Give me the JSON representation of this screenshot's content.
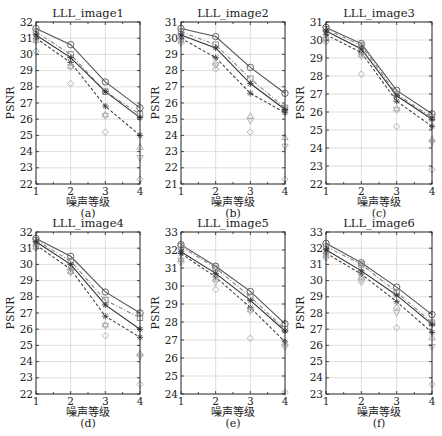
{
  "chart_data": [
    {
      "id": "a",
      "type": "line",
      "title": "LLL_image1",
      "caption": "(a)",
      "xlabel": "噪声等级",
      "ylabel": "PSNR",
      "x": [
        1,
        2,
        3,
        4
      ],
      "xlim": [
        1,
        4
      ],
      "ylim": [
        22,
        32
      ],
      "yticks": [
        22,
        23,
        24,
        25,
        26,
        27,
        28,
        29,
        30,
        31,
        32
      ],
      "grid": true,
      "series": [
        {
          "name": "s1",
          "style": "solid",
          "marker": "circle",
          "color": "#555555",
          "values": [
            31.6,
            30.6,
            28.3,
            26.7
          ]
        },
        {
          "name": "s2",
          "style": "dashdot",
          "marker": "square",
          "color": "#888888",
          "values": [
            31.4,
            30.0,
            27.7,
            26.3
          ]
        },
        {
          "name": "s3",
          "style": "solid",
          "marker": "star",
          "color": "#333333",
          "values": [
            31.2,
            29.8,
            27.7,
            26.1
          ]
        },
        {
          "name": "s4",
          "style": "dashed",
          "marker": "asterisk",
          "color": "#444444",
          "values": [
            31.0,
            29.5,
            26.8,
            25.0
          ]
        },
        {
          "name": "s5",
          "style": "none",
          "marker": "triangle-up",
          "color": "#aaaaaa",
          "values": [
            30.9,
            29.3,
            26.3,
            24.3
          ]
        },
        {
          "name": "s6",
          "style": "none",
          "marker": "triangle-down",
          "color": "#aaaaaa",
          "values": [
            30.8,
            29.2,
            26.2,
            23.6
          ]
        },
        {
          "name": "s7",
          "style": "none",
          "marker": "diamond",
          "color": "#aaaaaa",
          "values": [
            30.2,
            28.2,
            25.2,
            22.3
          ]
        }
      ]
    },
    {
      "id": "b",
      "type": "line",
      "title": "LLL_image2",
      "caption": "(b)",
      "xlabel": "噪声等级",
      "ylabel": "PSNR",
      "x": [
        1,
        2,
        3,
        4
      ],
      "xlim": [
        1,
        4
      ],
      "ylim": [
        21,
        31
      ],
      "yticks": [
        21,
        22,
        23,
        24,
        25,
        26,
        27,
        28,
        29,
        30,
        31
      ],
      "grid": true,
      "series": [
        {
          "name": "s1",
          "style": "solid",
          "marker": "circle",
          "color": "#555555",
          "values": [
            30.6,
            30.1,
            28.2,
            26.6
          ]
        },
        {
          "name": "s2",
          "style": "dashdot",
          "marker": "square",
          "color": "#888888",
          "values": [
            30.4,
            29.6,
            27.5,
            25.7
          ]
        },
        {
          "name": "s3",
          "style": "solid",
          "marker": "star",
          "color": "#333333",
          "values": [
            30.2,
            29.4,
            27.2,
            25.6
          ]
        },
        {
          "name": "s4",
          "style": "dashed",
          "marker": "asterisk",
          "color": "#444444",
          "values": [
            30.0,
            28.8,
            26.6,
            25.4
          ]
        },
        {
          "name": "s5",
          "style": "none",
          "marker": "triangle-up",
          "color": "#aaaaaa",
          "values": [
            29.9,
            28.5,
            25.2,
            23.9
          ]
        },
        {
          "name": "s6",
          "style": "none",
          "marker": "triangle-down",
          "color": "#aaaaaa",
          "values": [
            29.8,
            28.3,
            24.9,
            23.3
          ]
        },
        {
          "name": "s7",
          "style": "none",
          "marker": "diamond",
          "color": "#aaaaaa",
          "values": [
            29.7,
            28.1,
            24.2,
            21.3
          ]
        }
      ]
    },
    {
      "id": "c",
      "type": "line",
      "title": "LLL_image3",
      "caption": "(c)",
      "xlabel": "噪声等级",
      "ylabel": "PSNR",
      "x": [
        1,
        2,
        3,
        4
      ],
      "xlim": [
        1,
        4
      ],
      "ylim": [
        22,
        31
      ],
      "yticks": [
        22,
        23,
        24,
        25,
        26,
        27,
        28,
        29,
        30,
        31
      ],
      "grid": true,
      "series": [
        {
          "name": "s1",
          "style": "solid",
          "marker": "circle",
          "color": "#555555",
          "values": [
            30.7,
            29.8,
            27.2,
            25.9
          ]
        },
        {
          "name": "s2",
          "style": "dashdot",
          "marker": "square",
          "color": "#888888",
          "values": [
            30.6,
            29.7,
            27.0,
            25.7
          ]
        },
        {
          "name": "s3",
          "style": "solid",
          "marker": "star",
          "color": "#333333",
          "values": [
            30.5,
            29.5,
            26.9,
            25.6
          ]
        },
        {
          "name": "s4",
          "style": "dashed",
          "marker": "asterisk",
          "color": "#444444",
          "values": [
            30.3,
            29.3,
            26.6,
            25.2
          ]
        },
        {
          "name": "s5",
          "style": "none",
          "marker": "triangle-up",
          "color": "#aaaaaa",
          "values": [
            30.1,
            29.2,
            26.2,
            24.5
          ]
        },
        {
          "name": "s6",
          "style": "none",
          "marker": "triangle-down",
          "color": "#aaaaaa",
          "values": [
            30.0,
            29.1,
            26.1,
            24.3
          ]
        },
        {
          "name": "s7",
          "style": "none",
          "marker": "diamond",
          "color": "#aaaaaa",
          "values": [
            29.9,
            28.1,
            25.2,
            22.8
          ]
        }
      ]
    },
    {
      "id": "d",
      "type": "line",
      "title": "LLL_image4",
      "caption": "(d)",
      "xlabel": "噪声等级",
      "ylabel": "PSNR",
      "x": [
        1,
        2,
        3,
        4
      ],
      "xlim": [
        1,
        4
      ],
      "ylim": [
        22,
        32
      ],
      "yticks": [
        22,
        23,
        24,
        25,
        26,
        27,
        28,
        29,
        30,
        31,
        32
      ],
      "grid": true,
      "series": [
        {
          "name": "s1",
          "style": "solid",
          "marker": "circle",
          "color": "#555555",
          "values": [
            31.6,
            30.5,
            28.3,
            27.0
          ]
        },
        {
          "name": "s2",
          "style": "dashdot",
          "marker": "square",
          "color": "#888888",
          "values": [
            31.5,
            30.2,
            27.8,
            26.7
          ]
        },
        {
          "name": "s3",
          "style": "solid",
          "marker": "star",
          "color": "#333333",
          "values": [
            31.4,
            30.0,
            27.5,
            26.0
          ]
        },
        {
          "name": "s4",
          "style": "dashed",
          "marker": "asterisk",
          "color": "#444444",
          "values": [
            31.2,
            29.7,
            26.8,
            25.5
          ]
        },
        {
          "name": "s5",
          "style": "none",
          "marker": "triangle-up",
          "color": "#aaaaaa",
          "values": [
            31.1,
            29.6,
            26.3,
            24.5
          ]
        },
        {
          "name": "s6",
          "style": "none",
          "marker": "triangle-down",
          "color": "#aaaaaa",
          "values": [
            31.0,
            29.5,
            26.2,
            24.3
          ]
        },
        {
          "name": "s7",
          "style": "none",
          "marker": "diamond",
          "color": "#aaaaaa",
          "values": [
            31.0,
            29.5,
            25.6,
            22.6
          ]
        }
      ]
    },
    {
      "id": "e",
      "type": "line",
      "title": "LLL_image5",
      "caption": "(e)",
      "xlabel": "噪声等级",
      "ylabel": "PSNR",
      "x": [
        1,
        2,
        3,
        4
      ],
      "xlim": [
        1,
        4
      ],
      "ylim": [
        24,
        33
      ],
      "yticks": [
        24,
        25,
        26,
        27,
        28,
        29,
        30,
        31,
        32,
        33
      ],
      "grid": true,
      "series": [
        {
          "name": "s1",
          "style": "solid",
          "marker": "circle",
          "color": "#555555",
          "values": [
            32.3,
            31.1,
            29.7,
            27.9
          ]
        },
        {
          "name": "s2",
          "style": "dashdot",
          "marker": "square",
          "color": "#888888",
          "values": [
            32.2,
            31.0,
            29.4,
            27.6
          ]
        },
        {
          "name": "s3",
          "style": "solid",
          "marker": "star",
          "color": "#333333",
          "values": [
            31.9,
            30.7,
            29.2,
            27.5
          ]
        },
        {
          "name": "s4",
          "style": "dashed",
          "marker": "asterisk",
          "color": "#444444",
          "values": [
            31.8,
            30.5,
            28.8,
            26.9
          ]
        },
        {
          "name": "s5",
          "style": "none",
          "marker": "triangle-up",
          "color": "#aaaaaa",
          "values": [
            31.5,
            30.4,
            28.7,
            26.8
          ]
        },
        {
          "name": "s6",
          "style": "none",
          "marker": "triangle-down",
          "color": "#aaaaaa",
          "values": [
            31.4,
            30.2,
            28.6,
            26.6
          ]
        },
        {
          "name": "s7",
          "style": "none",
          "marker": "diamond",
          "color": "#aaaaaa",
          "values": [
            31.3,
            29.8,
            27.1,
            24.1
          ]
        }
      ]
    },
    {
      "id": "f",
      "type": "line",
      "title": "LLL_image6",
      "caption": "(f)",
      "xlabel": "噪声等级",
      "ylabel": "PSNR",
      "x": [
        1,
        2,
        3,
        4
      ],
      "xlim": [
        1,
        4
      ],
      "ylim": [
        23,
        33
      ],
      "yticks": [
        23,
        24,
        25,
        26,
        27,
        28,
        29,
        30,
        31,
        32,
        33
      ],
      "grid": true,
      "series": [
        {
          "name": "s1",
          "style": "solid",
          "marker": "circle",
          "color": "#555555",
          "values": [
            32.3,
            31.1,
            29.6,
            27.9
          ]
        },
        {
          "name": "s2",
          "style": "dashdot",
          "marker": "square",
          "color": "#888888",
          "values": [
            32.1,
            31.0,
            29.3,
            27.4
          ]
        },
        {
          "name": "s3",
          "style": "solid",
          "marker": "star",
          "color": "#333333",
          "values": [
            31.9,
            30.6,
            29.1,
            27.3
          ]
        },
        {
          "name": "s4",
          "style": "dashed",
          "marker": "asterisk",
          "color": "#444444",
          "values": [
            31.7,
            30.4,
            28.7,
            26.8
          ]
        },
        {
          "name": "s5",
          "style": "none",
          "marker": "triangle-up",
          "color": "#aaaaaa",
          "values": [
            31.6,
            30.2,
            28.4,
            26.5
          ]
        },
        {
          "name": "s6",
          "style": "none",
          "marker": "triangle-down",
          "color": "#aaaaaa",
          "values": [
            31.5,
            30.0,
            28.0,
            25.9
          ]
        },
        {
          "name": "s7",
          "style": "none",
          "marker": "diamond",
          "color": "#aaaaaa",
          "values": [
            31.4,
            29.9,
            27.1,
            23.6
          ]
        }
      ]
    }
  ],
  "layout": {
    "panels": [
      {
        "id": "a",
        "box": [
          36,
          22,
          140,
          184
        ]
      },
      {
        "id": "b",
        "box": [
          181,
          22,
          285,
          184
        ]
      },
      {
        "id": "c",
        "box": [
          326,
          22,
          432,
          184
        ]
      },
      {
        "id": "d",
        "box": [
          36,
          232,
          140,
          394
        ]
      },
      {
        "id": "e",
        "box": [
          181,
          232,
          285,
          394
        ]
      },
      {
        "id": "f",
        "box": [
          326,
          232,
          432,
          394
        ]
      }
    ]
  }
}
